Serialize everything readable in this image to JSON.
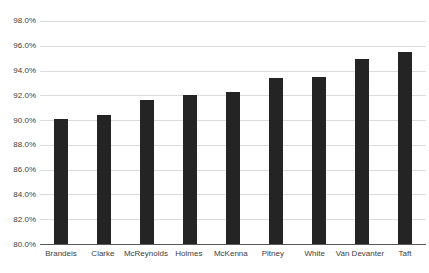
{
  "chart_data": {
    "type": "bar",
    "title": "",
    "xlabel": "",
    "ylabel": "",
    "categories": [
      "Brandeis",
      "Clarke",
      "McReynolds",
      "Holmes",
      "McKenna",
      "Pitney",
      "White",
      "Van Devanter",
      "Taft"
    ],
    "values": [
      90.1,
      90.4,
      91.6,
      92.0,
      92.3,
      93.4,
      93.5,
      94.9,
      95.5
    ],
    "ylim": [
      80,
      98
    ],
    "yticks": [
      80,
      82,
      84,
      86,
      88,
      90,
      92,
      94,
      96,
      98
    ],
    "ytick_labels": [
      "80.0%",
      "82.0%",
      "84.0%",
      "86.0%",
      "88.0%",
      "90.0%",
      "92.0%",
      "94.0%",
      "96.0%",
      "98.0%"
    ],
    "grid": true,
    "legend": false,
    "bar_color": "#242424",
    "gridline_color": "#dcdcdc",
    "axis_line_color": "#595959",
    "label_color": "#404040"
  }
}
